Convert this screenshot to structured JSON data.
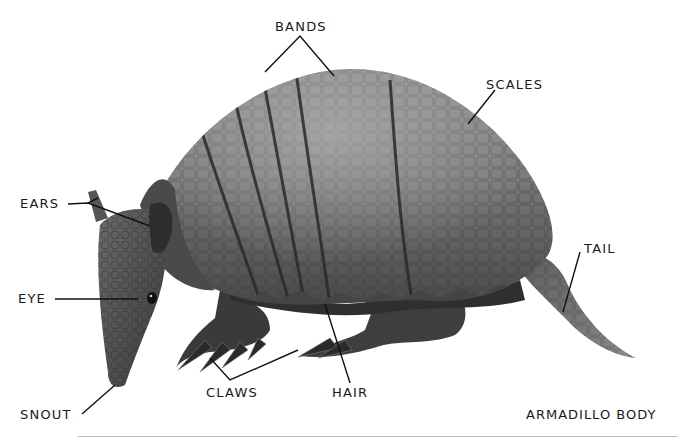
{
  "diagram": {
    "subject": "Armadillo",
    "caption": "ARMADILLO BODY",
    "labels": {
      "bands": "BANDS",
      "scales": "SCALES",
      "ears": "EARS",
      "eye": "EYE",
      "tail": "TAIL",
      "snout": "SNOUT",
      "claws": "CLAWS",
      "hair": "HAIR"
    },
    "colors": {
      "background": "#ffffff",
      "ink": "#1a1a1a",
      "shell_light": "#9a9a9a",
      "shell_mid": "#6e6e6e",
      "shell_dark": "#3c3c3c",
      "band_line": "#2a2a2a",
      "rule": "#b8b8b8"
    }
  }
}
